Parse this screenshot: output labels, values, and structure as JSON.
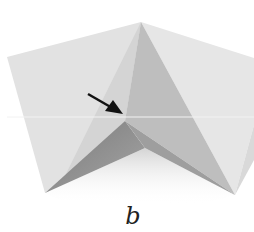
{
  "figure": {
    "caption": "b",
    "colors": {
      "background": "#ffffff",
      "paper_light": "#e4e4e4",
      "paper_mid": "#d2d2d2",
      "paper_shade": "#bdbdbd",
      "paper_dark": "#8c8c8c",
      "arrow": "#111111"
    },
    "arrow": {
      "from": [
        88,
        94
      ],
      "to": [
        122,
        114
      ]
    }
  }
}
